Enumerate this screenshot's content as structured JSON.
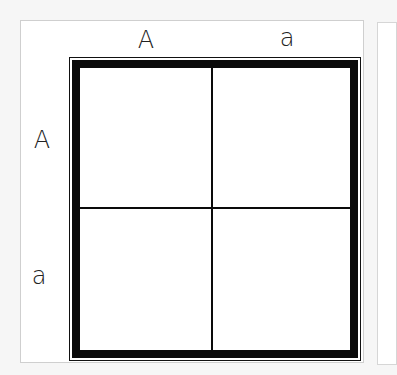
{
  "diagram": {
    "type": "punnett-square",
    "column_headers": [
      "A",
      "a"
    ],
    "row_headers": [
      "A",
      "a"
    ],
    "cells": [
      {
        "row": 0,
        "col": 0,
        "text": ""
      },
      {
        "row": 0,
        "col": 1,
        "text": ""
      },
      {
        "row": 1,
        "col": 0,
        "text": ""
      },
      {
        "row": 1,
        "col": 1,
        "text": ""
      }
    ]
  },
  "colors": {
    "background": "#f6f6f6",
    "card": "#ffffff",
    "frame": "#0a0a0a",
    "card_border": "#cfcfcf"
  }
}
